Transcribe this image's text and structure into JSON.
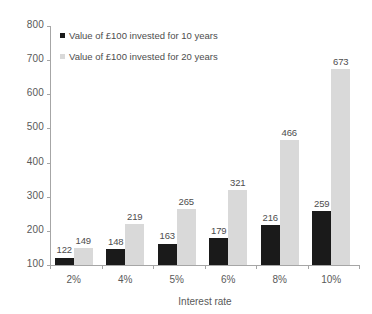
{
  "chart_data": {
    "type": "bar",
    "title": "",
    "xlabel": "Interest rate",
    "ylabel": "",
    "categories": [
      "2%",
      "4%",
      "5%",
      "6%",
      "8%",
      "10%"
    ],
    "series": [
      {
        "name": "Value of £100 invested for 10 years",
        "color": "#1a1a1a",
        "values": [
          122,
          148,
          163,
          179,
          216,
          259
        ]
      },
      {
        "name": "Value of £100 invested for 20 years",
        "color": "#d9d9d9",
        "values": [
          149,
          219,
          265,
          321,
          466,
          673
        ]
      }
    ],
    "ylim": [
      100,
      800
    ],
    "ytick_values": [
      800,
      700,
      600,
      500,
      400,
      300,
      200,
      100
    ],
    "ytick_labels": [
      "800",
      "700",
      "600",
      "500",
      "400",
      "300",
      "200",
      "100"
    ],
    "grid": false,
    "legend_position": "top-left",
    "data_labels": true,
    "axis_color": "#a6a6a6",
    "text_color": "#595959"
  },
  "legend": {
    "items": [
      {
        "label": "Value of £100 invested for 10 years",
        "swatch": "series-0-swatch"
      },
      {
        "label": "Value of £100 invested for 20 years",
        "swatch": "series-1-swatch"
      }
    ]
  },
  "axes": {
    "x_title": "Interest rate"
  }
}
